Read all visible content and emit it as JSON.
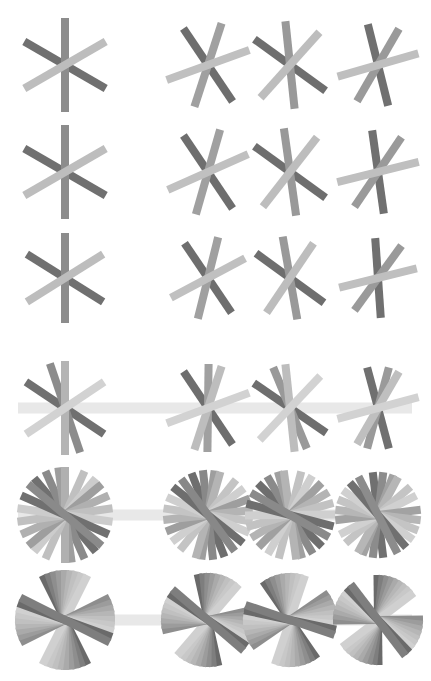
{
  "canvas": {
    "width": 431,
    "height": 681,
    "background_color": "#ffffff",
    "title": "asterisk-glyph-grid"
  },
  "palette": {
    "stroke_dark": "#6e6e6e",
    "stroke_mid": "#8c8c8c",
    "stroke_light": "#b4b4b4",
    "stroke_lighter": "#c4c4c4",
    "axis_bar": "#e8e8e8",
    "background": "#ffffff"
  },
  "grid": {
    "rows": 6,
    "columns": 4,
    "column_centers": [
      65,
      208,
      290,
      378
    ],
    "row_centers": [
      65,
      172,
      278,
      408,
      515,
      620
    ],
    "column_labels": [
      "col-1",
      "col-2",
      "col-3",
      "col-4"
    ],
    "row_labels": [
      "row-1",
      "row-2",
      "row-3",
      "row-4",
      "row-5",
      "row-6"
    ]
  },
  "axis_bar": {
    "visible_rows": [
      4,
      5,
      6
    ],
    "x_start": 18,
    "x_end": 412,
    "thickness": 11,
    "color": "#e8e8e8",
    "label": "horizontal-reference-bar"
  },
  "chart_data": {
    "type": "scatter",
    "title": "",
    "xlabel": "",
    "ylabel": "",
    "series": [
      {
        "name": "row-1",
        "spoke_pairs": 3,
        "glyphs": [
          {
            "col": 1,
            "cx": 65,
            "cy": 65,
            "radius": 47,
            "width": 8,
            "rotation": 0,
            "spread": 60,
            "colors": [
              "#707070",
              "#8c8c8c",
              "#bdbdbd"
            ]
          },
          {
            "col": 2,
            "cx": 208,
            "cy": 65,
            "radius": 44,
            "width": 8,
            "rotation": 18,
            "spread": 52,
            "colors": [
              "#6e6e6e",
              "#a0a0a0",
              "#c0c0c0"
            ]
          },
          {
            "col": 3,
            "cx": 290,
            "cy": 65,
            "radius": 44,
            "width": 8,
            "rotation": -6,
            "spread": 48,
            "colors": [
              "#6e6e6e",
              "#999999",
              "#bdbdbd"
            ]
          },
          {
            "col": 4,
            "cx": 378,
            "cy": 65,
            "radius": 42,
            "width": 8,
            "rotation": 30,
            "spread": 44,
            "colors": [
              "#707070",
              "#9a9a9a",
              "#bfbfbf"
            ]
          }
        ]
      },
      {
        "name": "row-2",
        "spoke_pairs": 3,
        "glyphs": [
          {
            "col": 1,
            "cx": 65,
            "cy": 172,
            "radius": 47,
            "width": 8,
            "rotation": 0,
            "spread": 60,
            "colors": [
              "#707070",
              "#8c8c8c",
              "#bdbdbd"
            ]
          },
          {
            "col": 2,
            "cx": 208,
            "cy": 172,
            "radius": 44,
            "width": 8,
            "rotation": 16,
            "spread": 50,
            "colors": [
              "#6e6e6e",
              "#a0a0a0",
              "#c0c0c0"
            ]
          },
          {
            "col": 3,
            "cx": 290,
            "cy": 172,
            "radius": 44,
            "width": 8,
            "rotation": -8,
            "spread": 46,
            "colors": [
              "#6e6e6e",
              "#999999",
              "#bdbdbd"
            ]
          },
          {
            "col": 4,
            "cx": 378,
            "cy": 172,
            "radius": 42,
            "width": 8,
            "rotation": 34,
            "spread": 42,
            "colors": [
              "#707070",
              "#9a9a9a",
              "#bfbfbf"
            ]
          }
        ]
      },
      {
        "name": "row-3",
        "spoke_pairs": 3,
        "glyphs": [
          {
            "col": 1,
            "cx": 65,
            "cy": 278,
            "radius": 45,
            "width": 8,
            "rotation": 0,
            "spread": 58,
            "colors": [
              "#707070",
              "#8c8c8c",
              "#bdbdbd"
            ]
          },
          {
            "col": 2,
            "cx": 208,
            "cy": 278,
            "radius": 42,
            "width": 8,
            "rotation": 14,
            "spread": 48,
            "colors": [
              "#6e6e6e",
              "#a0a0a0",
              "#c0c0c0"
            ]
          },
          {
            "col": 3,
            "cx": 290,
            "cy": 278,
            "radius": 42,
            "width": 8,
            "rotation": -10,
            "spread": 44,
            "colors": [
              "#6e6e6e",
              "#999999",
              "#bdbdbd"
            ]
          },
          {
            "col": 4,
            "cx": 378,
            "cy": 278,
            "radius": 40,
            "width": 8,
            "rotation": 36,
            "spread": 40,
            "colors": [
              "#707070",
              "#9a9a9a",
              "#bfbfbf"
            ]
          }
        ]
      },
      {
        "name": "row-4",
        "spoke_pairs": 4,
        "glyphs": [
          {
            "col": 1,
            "cx": 65,
            "cy": 408,
            "radius": 47,
            "width": 8,
            "rotation": 0,
            "spread": 50,
            "colors": [
              "#707070",
              "#8c8c8c",
              "#b4b4b4",
              "#d2d2d2"
            ]
          },
          {
            "col": 2,
            "cx": 208,
            "cy": 408,
            "radius": 44,
            "width": 8,
            "rotation": 18,
            "spread": 46,
            "colors": [
              "#6e6e6e",
              "#a0a0a0",
              "#bdbdbd",
              "#d2d2d2"
            ]
          },
          {
            "col": 3,
            "cx": 290,
            "cy": 408,
            "radius": 44,
            "width": 8,
            "rotation": -6,
            "spread": 44,
            "colors": [
              "#6e6e6e",
              "#999999",
              "#bdbdbd",
              "#d2d2d2"
            ]
          },
          {
            "col": 4,
            "cx": 378,
            "cy": 408,
            "radius": 42,
            "width": 8,
            "rotation": 30,
            "spread": 40,
            "colors": [
              "#707070",
              "#9a9a9a",
              "#bfbfbf",
              "#d2d2d2"
            ]
          }
        ]
      },
      {
        "name": "row-5",
        "spoke_pairs": 6,
        "glyphs": [
          {
            "col": 1,
            "cx": 65,
            "cy": 515,
            "radius": 48,
            "width": 8,
            "rotation": 0,
            "spread": 32,
            "colors": [
              "#707070",
              "#8a8a8a",
              "#9e9e9e",
              "#b0b0b0",
              "#c0c0c0",
              "#cccccc"
            ]
          },
          {
            "col": 2,
            "cx": 208,
            "cy": 515,
            "radius": 45,
            "width": 8,
            "rotation": 16,
            "spread": 30,
            "colors": [
              "#6e6e6e",
              "#888888",
              "#9e9e9e",
              "#b4b4b4",
              "#c4c4c4",
              "#cfcfcf"
            ]
          },
          {
            "col": 3,
            "cx": 290,
            "cy": 515,
            "radius": 45,
            "width": 8,
            "rotation": -8,
            "spread": 30,
            "colors": [
              "#6e6e6e",
              "#8a8a8a",
              "#a0a0a0",
              "#b4b4b4",
              "#c2c2c2",
              "#cfcfcf"
            ]
          },
          {
            "col": 4,
            "cx": 378,
            "cy": 515,
            "radius": 43,
            "width": 8,
            "rotation": 28,
            "spread": 28,
            "colors": [
              "#707070",
              "#8c8c8c",
              "#a2a2a2",
              "#b6b6b6",
              "#c4c4c4",
              "#d0d0d0"
            ]
          }
        ]
      },
      {
        "name": "row-6",
        "spoke_pairs": 9,
        "glyphs": [
          {
            "col": 1,
            "cx": 65,
            "cy": 620,
            "radius": 50,
            "width": 8,
            "rotation": 0,
            "spread": 20,
            "colors": [
              "#6a6a6a",
              "#7e7e7e",
              "#8e8e8e",
              "#9c9c9c",
              "#aaaaaa",
              "#b6b6b6",
              "#c0c0c0",
              "#c8c8c8",
              "#d0d0d0"
            ]
          },
          {
            "col": 2,
            "cx": 208,
            "cy": 620,
            "radius": 47,
            "width": 8,
            "rotation": 14,
            "spread": 20,
            "colors": [
              "#6a6a6a",
              "#7e7e7e",
              "#8e8e8e",
              "#9c9c9c",
              "#aaaaaa",
              "#b6b6b6",
              "#c0c0c0",
              "#c8c8c8",
              "#d0d0d0"
            ]
          },
          {
            "col": 3,
            "cx": 290,
            "cy": 620,
            "radius": 47,
            "width": 8,
            "rotation": -8,
            "spread": 20,
            "colors": [
              "#6a6a6a",
              "#7e7e7e",
              "#8e8e8e",
              "#9c9c9c",
              "#aaaaaa",
              "#b6b6b6",
              "#c0c0c0",
              "#c8c8c8",
              "#d0d0d0"
            ]
          },
          {
            "col": 4,
            "cx": 378,
            "cy": 620,
            "radius": 45,
            "width": 8,
            "rotation": 26,
            "spread": 20,
            "colors": [
              "#6a6a6a",
              "#7e7e7e",
              "#8e8e8e",
              "#9c9c9c",
              "#aaaaaa",
              "#b6b6b6",
              "#c0c0c0",
              "#c8c8c8",
              "#d0d0d0"
            ]
          }
        ]
      }
    ]
  }
}
